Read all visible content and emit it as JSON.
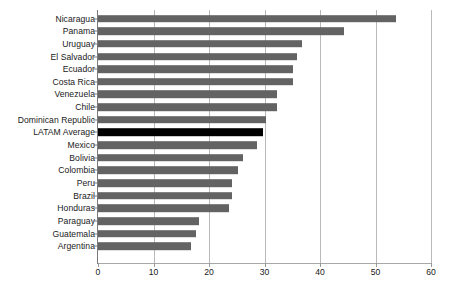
{
  "chart_data": {
    "type": "bar",
    "orientation": "horizontal",
    "title": "",
    "subtitle": "",
    "xlabel": "",
    "ylabel": "",
    "xlim": [
      0,
      60
    ],
    "xticks": [
      0,
      10,
      20,
      30,
      40,
      50,
      60
    ],
    "grid": "vertical",
    "legend": "none",
    "highlight_category": "LATAM Average",
    "colors": {
      "bar": "#636363",
      "highlight_bar": "#000000",
      "gridline": "#b9b9b9",
      "axis": "#7a7a7a",
      "text": "#1a1a1a",
      "background": "#ffffff"
    },
    "categories": [
      "Nicaragua",
      "Panama",
      "Uruguay",
      "El Salvador",
      "Ecuador",
      "Costa Rica",
      "Venezuela",
      "Chile",
      "Dominican Republic",
      "LATAM Average",
      "Mexico",
      "Bolivia",
      "Colombia",
      "Peru",
      "Brazil",
      "Honduras",
      "Paraguay",
      "Guatemala",
      "Argentina"
    ],
    "values": [
      53.7,
      44.3,
      36.8,
      35.9,
      35.2,
      35.1,
      32.3,
      32.2,
      30.3,
      29.8,
      28.6,
      26.1,
      25.2,
      24.2,
      24.1,
      23.6,
      18.2,
      17.7,
      16.8
    ]
  }
}
